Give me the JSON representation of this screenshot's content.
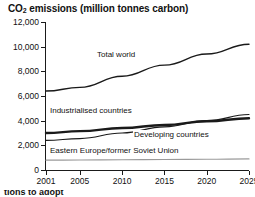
{
  "title_prefix": "CO",
  "title_sub": "2",
  "title_rest": " emissions (million tonnes carbon)",
  "title_full": "CO2 emissions (million tonnes carbon)",
  "caption_partial": "tions to adopt",
  "axes": {
    "y_ticks": [
      "12,000",
      "10,000",
      "8,000",
      "6,000",
      "4,000",
      "2,000",
      "0"
    ],
    "y_values": [
      12000,
      10000,
      8000,
      6000,
      4000,
      2000,
      0
    ],
    "x_ticks": [
      "2001",
      "2005",
      "2010",
      "2015",
      "2020",
      "2025"
    ],
    "x_values": [
      2001,
      2005,
      2010,
      2015,
      2020,
      2025
    ]
  },
  "labels": {
    "total_world": "Total world",
    "industrialised": "Industrialised countries",
    "developing": "Developing countries",
    "eastern_europe": "Eastern Europe/former Soviet Union"
  },
  "colors": {
    "total_world": "#1a1a1a",
    "industrialised": "#1a1a1a",
    "developing": "#1a1a1a",
    "eastern_europe": "#9a9a9a",
    "axis": "#1a1a1a",
    "background": "#ffffff"
  },
  "chart_data": {
    "type": "line",
    "title": "CO2 emissions (million tonnes carbon)",
    "xlabel": "",
    "ylabel": "",
    "xlim": [
      2001,
      2025
    ],
    "ylim": [
      0,
      12000
    ],
    "grid": false,
    "legend": "inline-annotations",
    "x": [
      2001,
      2005,
      2010,
      2015,
      2020,
      2025
    ],
    "series": [
      {
        "name": "Total world",
        "values": [
          6400,
          6700,
          7600,
          8500,
          9400,
          10200
        ],
        "color": "#1a1a1a",
        "width": 1.4
      },
      {
        "name": "Industrialised countries",
        "values": [
          3000,
          3150,
          3400,
          3650,
          3950,
          4200
        ],
        "color": "#1a1a1a",
        "width": 2.4
      },
      {
        "name": "Developing countries",
        "values": [
          2400,
          2550,
          3000,
          3500,
          4000,
          4500
        ],
        "color": "#1a1a1a",
        "width": 1.2
      },
      {
        "name": "Eastern Europe/former Soviet Union",
        "values": [
          800,
          810,
          830,
          850,
          870,
          900
        ],
        "color": "#9a9a9a",
        "width": 1.2
      }
    ]
  }
}
